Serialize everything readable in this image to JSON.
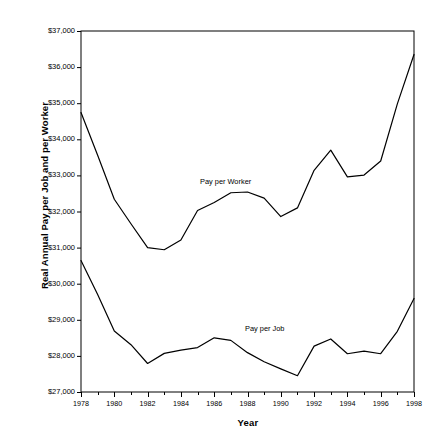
{
  "chart_data": {
    "type": "line",
    "title": "",
    "xlabel": "Year",
    "ylabel": "Real Annual Pay per Job and per Worker",
    "xlim": [
      1978,
      1998
    ],
    "ylim": [
      27000,
      37000
    ],
    "grid": false,
    "legend_position": "inline-annotation",
    "x": [
      1978,
      1979,
      1980,
      1981,
      1982,
      1983,
      1984,
      1985,
      1986,
      1987,
      1988,
      1989,
      1990,
      1991,
      1992,
      1993,
      1994,
      1995,
      1996,
      1997,
      1998
    ],
    "y_tick_labels": [
      "$37,000",
      "$36,000",
      "$35,000",
      "$34,000",
      "$33,000",
      "$32,000",
      "$31,000",
      "$30,000",
      "$29,000",
      "$28,000",
      "$27,000"
    ],
    "y_ticks": [
      37000,
      36000,
      35000,
      34000,
      33000,
      32000,
      31000,
      30000,
      29000,
      28000,
      27000
    ],
    "x_tick_labels": [
      "1978",
      "1980",
      "1982",
      "1984",
      "1986",
      "1988",
      "1990",
      "1992",
      "1994",
      "1996",
      "1998"
    ],
    "x_ticks": [
      1978,
      1980,
      1982,
      1984,
      1986,
      1988,
      1990,
      1992,
      1994,
      1996,
      1998
    ],
    "series": [
      {
        "name": "Pay per Worker",
        "color": "#000000",
        "annotation_label": "Pay per Worker",
        "values": [
          34740,
          33560,
          32340,
          31660,
          31000,
          30940,
          31210,
          32030,
          32250,
          32520,
          32540,
          32370,
          31860,
          32100,
          33140,
          33700,
          32960,
          33010,
          33400,
          34980,
          36350
        ]
      },
      {
        "name": "Pay per Job",
        "color": "#000000",
        "annotation_label": "Pay per Job",
        "values": [
          30640,
          29700,
          28690,
          28310,
          27790,
          28070,
          28160,
          28230,
          28500,
          28430,
          28090,
          27840,
          27640,
          27450,
          28270,
          28470,
          28060,
          28130,
          28060,
          28680,
          29590
        ]
      }
    ]
  },
  "annotations": {
    "pay_per_worker": {
      "label": "Pay per Worker",
      "x_px": 200,
      "y_px": 178
    },
    "pay_per_job": {
      "label": "Pay per Job",
      "x_px": 245,
      "y_px": 325
    }
  },
  "style": {
    "line_color": "#000000",
    "axis_color": "#000000",
    "background": "#ffffff"
  }
}
